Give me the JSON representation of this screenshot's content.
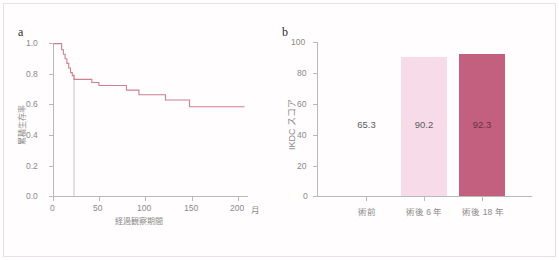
{
  "figure": {
    "panel_a_label": "a",
    "panel_b_label": "b"
  },
  "chart_data": [
    {
      "id": "panel-a",
      "type": "line",
      "subtype": "kaplan-meier-step",
      "title": "",
      "panel_label": "a",
      "xlabel": "経過観察期間",
      "xunit": "月",
      "ylabel": "累積生存率",
      "xlim": [
        0,
        220
      ],
      "ylim": [
        0.0,
        1.0
      ],
      "xticks": [
        0,
        50,
        100,
        150,
        200
      ],
      "xtick_labels": [
        "0",
        "50",
        "100",
        "150",
        "200"
      ],
      "yticks": [
        0.0,
        0.2,
        0.4,
        0.6,
        0.8,
        1.0
      ],
      "ytick_labels": [
        "0.0",
        "0.2",
        "0.4",
        "0.6",
        "0.8",
        "1.0"
      ],
      "grid": false,
      "legend": "none",
      "line_color": "#cf7f90",
      "reference_line": {
        "x": 23,
        "color": "#bdbdbd",
        "label": ""
      },
      "series": [
        {
          "name": "累積生存率",
          "points": [
            [
              0,
              1.0
            ],
            [
              8,
              1.0
            ],
            [
              9,
              0.96
            ],
            [
              11,
              0.93
            ],
            [
              13,
              0.9
            ],
            [
              15,
              0.87
            ],
            [
              17,
              0.84
            ],
            [
              19,
              0.81
            ],
            [
              21,
              0.79
            ],
            [
              23,
              0.765
            ],
            [
              42,
              0.765
            ],
            [
              43,
              0.745
            ],
            [
              50,
              0.745
            ],
            [
              51,
              0.725
            ],
            [
              81,
              0.725
            ],
            [
              82,
              0.695
            ],
            [
              95,
              0.695
            ],
            [
              96,
              0.665
            ],
            [
              125,
              0.665
            ],
            [
              126,
              0.63
            ],
            [
              152,
              0.63
            ],
            [
              153,
              0.585
            ],
            [
              215,
              0.585
            ]
          ]
        }
      ]
    },
    {
      "id": "panel-b",
      "type": "bar",
      "title": "",
      "panel_label": "b",
      "xlabel": "",
      "ylabel": "IKDC スコア",
      "ylim": [
        0,
        100
      ],
      "yticks": [
        0,
        20,
        40,
        60,
        80,
        100
      ],
      "ytick_labels": [
        "0",
        "20",
        "40",
        "60",
        "80",
        "100"
      ],
      "grid": false,
      "legend": "none",
      "categories": [
        "術前",
        "術後 6 年",
        "術後 18 年"
      ],
      "values": [
        65.3,
        90.2,
        92.3
      ],
      "value_labels": [
        "65.3",
        "90.2",
        "92.3"
      ],
      "bar_colors": [
        "#ffffff",
        "#f7dbe8",
        "#c4607f"
      ],
      "bars_drawn": [
        false,
        true,
        true
      ]
    }
  ],
  "colors": {
    "km_line": "#cf7f90",
    "axis": "#b9b9b9",
    "tick_text": "#8a8a8a",
    "bar_light": "#f7dbe8",
    "bar_dark": "#c4607f",
    "frame_border": "#f0dde4",
    "value_text": "#5c5c5c"
  }
}
